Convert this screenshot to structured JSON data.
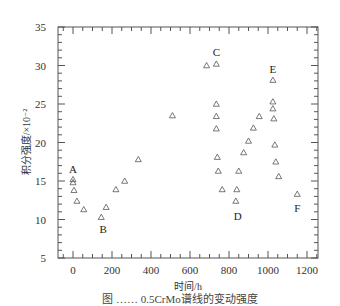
{
  "chart_data": {
    "type": "scatter",
    "title": "",
    "xlabel": "时间/h",
    "ylabel": "积分强度/×10⁻²",
    "xlim": [
      -80,
      1250
    ],
    "ylim": [
      5,
      35
    ],
    "x_ticks": [
      0,
      200,
      400,
      600,
      800,
      1000,
      1200
    ],
    "y_ticks": [
      5,
      10,
      15,
      20,
      25,
      30,
      35
    ],
    "grid": false,
    "marker": "triangle-open",
    "series": [
      {
        "name": "积分强度",
        "points": [
          {
            "x": 0,
            "y": 15.2
          },
          {
            "x": 0,
            "y": 14.8
          },
          {
            "x": 5,
            "y": 13.8
          },
          {
            "x": 20,
            "y": 12.4
          },
          {
            "x": 55,
            "y": 11.3
          },
          {
            "x": 145,
            "y": 10.3
          },
          {
            "x": 170,
            "y": 11.6
          },
          {
            "x": 220,
            "y": 13.9
          },
          {
            "x": 265,
            "y": 15.0
          },
          {
            "x": 335,
            "y": 17.8
          },
          {
            "x": 510,
            "y": 23.5
          },
          {
            "x": 685,
            "y": 30.0
          },
          {
            "x": 735,
            "y": 30.2
          },
          {
            "x": 735,
            "y": 25.0
          },
          {
            "x": 735,
            "y": 23.4
          },
          {
            "x": 735,
            "y": 21.8
          },
          {
            "x": 740,
            "y": 18.1
          },
          {
            "x": 745,
            "y": 16.3
          },
          {
            "x": 765,
            "y": 13.9
          },
          {
            "x": 835,
            "y": 12.4
          },
          {
            "x": 840,
            "y": 13.9
          },
          {
            "x": 850,
            "y": 16.3
          },
          {
            "x": 875,
            "y": 18.7
          },
          {
            "x": 900,
            "y": 20.2
          },
          {
            "x": 925,
            "y": 21.9
          },
          {
            "x": 955,
            "y": 23.4
          },
          {
            "x": 1025,
            "y": 28.1
          },
          {
            "x": 1025,
            "y": 25.3
          },
          {
            "x": 1025,
            "y": 24.4
          },
          {
            "x": 1030,
            "y": 23.1
          },
          {
            "x": 1035,
            "y": 19.7
          },
          {
            "x": 1040,
            "y": 17.5
          },
          {
            "x": 1055,
            "y": 15.6
          },
          {
            "x": 1150,
            "y": 13.3
          }
        ]
      }
    ],
    "annotations": [
      {
        "text": "A",
        "x": 0,
        "y": 16.5
      },
      {
        "text": "B",
        "x": 155,
        "y": 8.8
      },
      {
        "text": "C",
        "x": 735,
        "y": 31.8
      },
      {
        "text": "D",
        "x": 845,
        "y": 10.5
      },
      {
        "text": "E",
        "x": 1025,
        "y": 29.6
      },
      {
        "text": "F",
        "x": 1150,
        "y": 11.5
      }
    ]
  },
  "caption": "图  ……  0.5CrMo谱线的变动强度"
}
